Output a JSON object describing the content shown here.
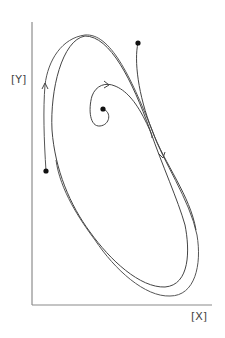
{
  "diagram": {
    "type": "phase-portrait",
    "axes": {
      "x_label": "[X]",
      "y_label": "[Y]"
    },
    "initial_points": [
      {
        "id": "upper-right-start",
        "x": 138,
        "y": 43
      },
      {
        "id": "center-start",
        "x": 103,
        "y": 109
      },
      {
        "id": "left-start",
        "x": 46,
        "y": 171
      }
    ],
    "stroke_color": "#444444",
    "axis_color": "#777777"
  }
}
